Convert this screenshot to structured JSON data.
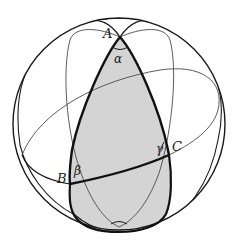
{
  "figure": {
    "colors": {
      "background": "#ffffff",
      "stroke": "#1a1a1a",
      "thin_stroke": "#4a4a4a",
      "shade": "#d4d4d4"
    }
  },
  "labels": {
    "vertices": {
      "A": "A",
      "B": "B",
      "C": "C"
    },
    "angles": {
      "alpha": "α",
      "beta": "β",
      "gamma": "γ"
    }
  }
}
